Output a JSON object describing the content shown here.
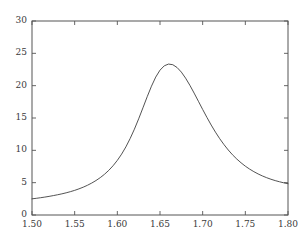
{
  "chart_data": {
    "type": "line",
    "title": "",
    "subtitle": "",
    "xlabel": "",
    "ylabel": "",
    "xlim": [
      1.5,
      1.8
    ],
    "ylim": [
      0,
      30
    ],
    "grid": false,
    "legend": null,
    "x_ticks": [
      1.5,
      1.55,
      1.6,
      1.65,
      1.7,
      1.75,
      1.8
    ],
    "x_tick_labels": [
      "1.50",
      "1.55",
      "1.60",
      "1.65",
      "1.70",
      "1.75",
      "1.80"
    ],
    "y_ticks": [
      0,
      5,
      10,
      15,
      20,
      25,
      30
    ],
    "y_tick_labels": [
      "0",
      "5",
      "10",
      "15",
      "20",
      "25",
      "30"
    ],
    "line_color": "#404040",
    "line_width": 0.9,
    "frame_color": "#555555",
    "background_color": "#ffffff",
    "annotations": [],
    "series": [
      {
        "name": "resonance",
        "peak_x": 1.652,
        "peak_y": 23.5,
        "x": [
          1.5,
          1.505,
          1.51,
          1.515,
          1.52,
          1.525,
          1.53,
          1.535,
          1.54,
          1.545,
          1.55,
          1.555,
          1.56,
          1.565,
          1.57,
          1.575,
          1.58,
          1.585,
          1.59,
          1.595,
          1.6,
          1.605,
          1.61,
          1.615,
          1.62,
          1.625,
          1.63,
          1.635,
          1.64,
          1.645,
          1.65,
          1.655,
          1.66,
          1.665,
          1.67,
          1.675,
          1.68,
          1.685,
          1.69,
          1.695,
          1.7,
          1.705,
          1.71,
          1.715,
          1.72,
          1.725,
          1.73,
          1.735,
          1.74,
          1.745,
          1.75,
          1.755,
          1.76,
          1.765,
          1.77,
          1.775,
          1.78,
          1.785,
          1.79,
          1.795,
          1.8
        ],
        "y": [
          2.5,
          2.58,
          2.67,
          2.77,
          2.88,
          3.0,
          3.13,
          3.27,
          3.43,
          3.61,
          3.81,
          4.04,
          4.3,
          4.6,
          4.94,
          5.33,
          5.78,
          6.3,
          6.91,
          7.62,
          8.45,
          9.41,
          10.53,
          11.82,
          13.27,
          14.87,
          16.57,
          18.29,
          19.92,
          21.33,
          22.4,
          23.07,
          23.34,
          23.24,
          22.81,
          22.1,
          21.16,
          20.06,
          18.85,
          17.59,
          16.32,
          15.09,
          13.91,
          12.81,
          11.8,
          10.88,
          10.05,
          9.31,
          8.65,
          8.07,
          7.55,
          7.1,
          6.7,
          6.35,
          6.04,
          5.77,
          5.53,
          5.32,
          5.14,
          4.98,
          4.84
        ]
      }
    ]
  }
}
